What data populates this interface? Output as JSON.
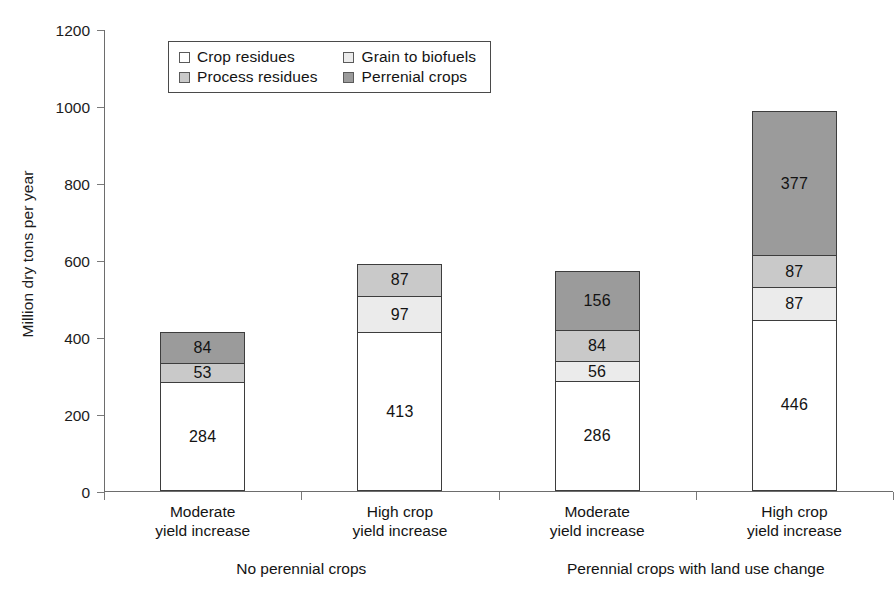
{
  "chart_data": {
    "type": "bar",
    "subtype": "stacked",
    "title": "",
    "xlabel": "",
    "ylabel": "Million dry tons per year",
    "ylim": [
      0,
      1200
    ],
    "ytick_labels": [
      "0",
      "200",
      "400",
      "600",
      "800",
      "1000",
      "1200"
    ],
    "yticks": [
      0,
      200,
      400,
      600,
      800,
      1000,
      1200
    ],
    "grid": false,
    "legend_position": "top-left-inside",
    "categories": [
      "Moderate yield increase",
      "High crop yield increase",
      "Moderate yield increase",
      "High crop yield increase"
    ],
    "category_lines": [
      [
        "Moderate",
        "yield increase"
      ],
      [
        "High crop",
        "yield increase"
      ],
      [
        "Moderate",
        "yield increase"
      ],
      [
        "High crop",
        "yield increase"
      ]
    ],
    "groups": [
      {
        "label": "No perennial crops",
        "categories": [
          0,
          1
        ]
      },
      {
        "label": "Perennial crops with land use change",
        "categories": [
          2,
          3
        ]
      }
    ],
    "series": [
      {
        "name": "Crop residues",
        "color": "#ffffff",
        "values": [
          284,
          413,
          286,
          446
        ]
      },
      {
        "name": "Grain to biofuels",
        "color": "#ebebeb",
        "values": [
          null,
          97,
          56,
          87
        ]
      },
      {
        "name": "Process residues",
        "color": "#c9c9c9",
        "values": [
          53,
          null,
          84,
          87
        ]
      },
      {
        "name": "Perrenial crops",
        "color": "#9b9b9b",
        "values": [
          84,
          87,
          156,
          377
        ]
      }
    ],
    "bar_totals": [
      421,
      597,
      582,
      997
    ],
    "data_labels": [
      [
        "284",
        "53",
        "84"
      ],
      [
        "413",
        "97",
        "87"
      ],
      [
        "286",
        "56",
        "84",
        "156"
      ],
      [
        "446",
        "87",
        "87",
        "377"
      ]
    ]
  },
  "legend": {
    "items": [
      {
        "label": "Crop residues",
        "color": "#ffffff",
        "icon": "legend-swatch-icon"
      },
      {
        "label": "Grain to biofuels",
        "color": "#ebebeb",
        "icon": "legend-swatch-icon"
      },
      {
        "label": "Process residues",
        "color": "#c9c9c9",
        "icon": "legend-swatch-icon"
      },
      {
        "label": "Perrenial crops",
        "color": "#9b9b9b",
        "icon": "legend-swatch-icon"
      }
    ]
  },
  "axes": {
    "y_title": "Million dry tons per year"
  },
  "bars": [
    {
      "segments": [
        {
          "label": "284",
          "value": 284,
          "series": "Crop residues",
          "color": "#ffffff"
        },
        {
          "label": "53",
          "value": 53,
          "series": "Process residues",
          "color": "#c9c9c9"
        },
        {
          "label": "84",
          "value": 84,
          "series": "Perrenial crops",
          "color": "#9b9b9b"
        }
      ]
    },
    {
      "segments": [
        {
          "label": "413",
          "value": 413,
          "series": "Crop residues",
          "color": "#ffffff"
        },
        {
          "label": "97",
          "value": 97,
          "series": "Grain to biofuels",
          "color": "#ebebeb"
        },
        {
          "label": "87",
          "value": 87,
          "series": "Process residues",
          "color": "#c9c9c9"
        }
      ]
    },
    {
      "segments": [
        {
          "label": "286",
          "value": 286,
          "series": "Crop residues",
          "color": "#ffffff"
        },
        {
          "label": "56",
          "value": 56,
          "series": "Grain to biofuels",
          "color": "#ebebeb"
        },
        {
          "label": "84",
          "value": 84,
          "series": "Process residues",
          "color": "#c9c9c9"
        },
        {
          "label": "156",
          "value": 156,
          "series": "Perrenial crops",
          "color": "#9b9b9b"
        }
      ]
    },
    {
      "segments": [
        {
          "label": "446",
          "value": 446,
          "series": "Crop residues",
          "color": "#ffffff"
        },
        {
          "label": "87",
          "value": 87,
          "series": "Grain to biofuels",
          "color": "#ebebeb"
        },
        {
          "label": "87",
          "value": 87,
          "series": "Process residues",
          "color": "#c9c9c9"
        },
        {
          "label": "377",
          "value": 377,
          "series": "Perrenial crops",
          "color": "#9b9b9b"
        }
      ]
    }
  ]
}
